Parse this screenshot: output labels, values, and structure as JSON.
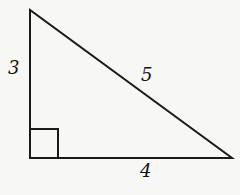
{
  "figure": {
    "type": "right-triangle",
    "sides": {
      "vertical_leg": "3",
      "hypotenuse": "5",
      "horizontal_leg": "4"
    },
    "right_angle_marker": true,
    "colors": {
      "stroke": "#1a1a1a",
      "background": "#f7f7f5"
    }
  }
}
